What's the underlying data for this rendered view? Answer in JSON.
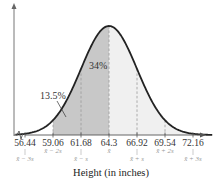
{
  "chart_data": {
    "type": "area",
    "title": "",
    "xlabel": "Height (in inches)",
    "ylabel": "",
    "distribution": "normal",
    "mean": 64.3,
    "std_dev": 2.62,
    "xlim": [
      56.44,
      72.16
    ],
    "ticks": [
      {
        "value": 56.44,
        "label": "56.44",
        "symbol": "x̄ − 3s"
      },
      {
        "value": 59.06,
        "label": "59.06",
        "symbol": "x̄ − 2s"
      },
      {
        "value": 61.68,
        "label": "61.68",
        "symbol": "x̄ − s"
      },
      {
        "value": 64.3,
        "label": "64.3",
        "symbol": "x̄"
      },
      {
        "value": 66.92,
        "label": "66.92",
        "symbol": "x̄ + s"
      },
      {
        "value": 69.54,
        "label": "69.54",
        "symbol": "x̄ + 2s"
      },
      {
        "value": 72.16,
        "label": "72.16",
        "symbol": "x̄ + 3s"
      }
    ],
    "shaded_regions": [
      {
        "from": 59.06,
        "to": 61.68,
        "shade": "dark",
        "color": "#c8c8c8",
        "percent_label": "13.5%"
      },
      {
        "from": 61.68,
        "to": 64.3,
        "shade": "dark",
        "color": "#c8c8c8",
        "percent_label": "34%"
      },
      {
        "from": 64.3,
        "to": 72.16,
        "shade": "light",
        "color": "#f0f0f0"
      }
    ],
    "annotations": [
      {
        "text": "34%",
        "region": [
          61.68,
          64.3
        ]
      },
      {
        "text": "13.5%",
        "region": [
          59.06,
          61.68
        ]
      }
    ],
    "curve_color": "#222222",
    "axis_color": "#555555",
    "dashed_line_color": "#999999",
    "grid": false,
    "legend": "none"
  }
}
